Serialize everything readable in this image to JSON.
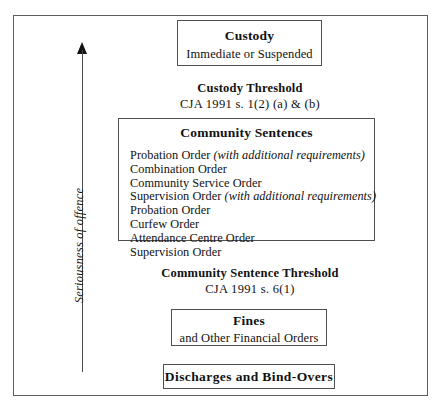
{
  "figure": {
    "axis": {
      "label": "Seriousness of offence",
      "arrow_direction": "up",
      "icon": "up-arrow-icon"
    },
    "custody": {
      "title": "Custody",
      "subtitle": "Immediate or Suspended"
    },
    "custody_threshold": {
      "title": "Custody Threshold",
      "reference": "CJA 1991 s. 1(2) (a) & (b)"
    },
    "community_sentences": {
      "title": "Community Sentences",
      "items": [
        {
          "name": "Probation Order",
          "note": "(with additional requirements)"
        },
        {
          "name": "Combination Order",
          "note": ""
        },
        {
          "name": "Community Service Order",
          "note": ""
        },
        {
          "name": "Supervision Order",
          "note": "(with additional requirements)"
        },
        {
          "name": "Probation Order",
          "note": ""
        },
        {
          "name": "Curfew Order",
          "note": ""
        },
        {
          "name": "Attendance Centre Order",
          "note": ""
        },
        {
          "name": "Supervision Order",
          "note": ""
        }
      ]
    },
    "community_threshold": {
      "title": "Community Sentence Threshold",
      "reference": "CJA 1991 s. 6(1)"
    },
    "fines": {
      "title": "Fines",
      "subtitle": "and Other Financial Orders"
    },
    "discharges": {
      "title": "Discharges and Bind-Overs"
    },
    "colors": {
      "border": "#4f4f4f",
      "frame": "#5d5d5d",
      "text": "#111111",
      "background": "#ffffff"
    }
  }
}
